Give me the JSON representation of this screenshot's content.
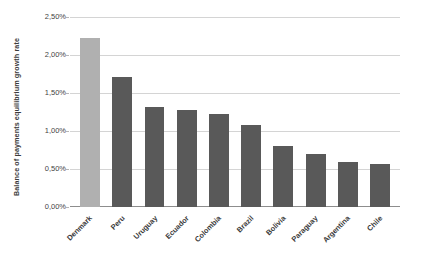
{
  "chart_data": {
    "type": "bar",
    "title": "",
    "xlabel": "",
    "ylabel": "Balance of payments equilibrium growth rate",
    "ylim": [
      0,
      2.5
    ],
    "ytick_labels": [
      "2,50%",
      "2,00%",
      "1,50%",
      "1,00%",
      "0,50%",
      "0,00%"
    ],
    "ytick_values": [
      2.5,
      2.0,
      1.5,
      1.0,
      0.5,
      0.0
    ],
    "grid": true,
    "legend": "none",
    "categories": [
      "Denmark",
      "Peru",
      "Uruguay",
      "Ecuador",
      "Colombia",
      "Brazil",
      "Bolivia",
      "Paraguay",
      "Argentina",
      "Chile"
    ],
    "values": [
      2.22,
      1.71,
      1.31,
      1.28,
      1.23,
      1.08,
      0.8,
      0.7,
      0.59,
      0.56
    ],
    "value_labels": [
      "2,22%",
      "1,71%",
      "1,31%",
      "1,28%",
      "1,23%",
      "1,08%",
      "0,80%",
      "0,70%",
      "0,59%",
      "0,56%"
    ],
    "bar_colors": [
      "#b0b0b0",
      "#595959",
      "#595959",
      "#595959",
      "#595959",
      "#595959",
      "#595959",
      "#595959",
      "#595959",
      "#595959"
    ],
    "highlight_index": 0,
    "colors": {
      "bar_default": "#595959",
      "bar_highlight": "#b0b0b0",
      "gridline": "#d4d4d4",
      "axis": "#8d8d8d",
      "text": "#3a3a3a",
      "background": "#ffffff"
    }
  }
}
